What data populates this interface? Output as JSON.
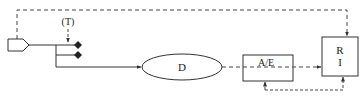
{
  "diagram": {
    "labels": {
      "t_label": "(T)",
      "d_label": "D",
      "ae_label": "A/E",
      "r_label_top": "R",
      "r_label_bottom": "I"
    },
    "colors": {
      "stroke": "#333333",
      "background": "#ffffff"
    },
    "nodes": [
      {
        "id": "source",
        "shape": "pentagon"
      },
      {
        "id": "junction-diamond-1",
        "shape": "diamond"
      },
      {
        "id": "junction-diamond-2",
        "shape": "diamond"
      },
      {
        "id": "D",
        "shape": "ellipse",
        "label": "D"
      },
      {
        "id": "AE",
        "shape": "rectangle",
        "label": "A/E"
      },
      {
        "id": "RI",
        "shape": "rectangle",
        "label": "R I"
      }
    ],
    "edges": [
      {
        "from": "source",
        "to": "RI",
        "style": "dashed",
        "route": "top"
      },
      {
        "from": "(T)",
        "to": "junction-diamond-1",
        "style": "dashed"
      },
      {
        "from": "source",
        "to": "junction-diamond-1",
        "style": "solid"
      },
      {
        "from": "source",
        "to": "junction-diamond-2",
        "style": "solid"
      },
      {
        "from": "source",
        "to": "D",
        "style": "solid"
      },
      {
        "from": "D",
        "to": "AE",
        "style": "dashed"
      },
      {
        "from": "AE",
        "to": "RI",
        "style": "dashed"
      },
      {
        "from": "RI",
        "to": "AE",
        "style": "dashed",
        "route": "bottom-loop"
      }
    ]
  }
}
